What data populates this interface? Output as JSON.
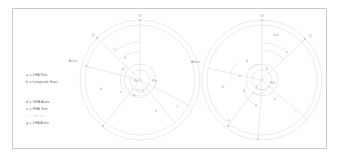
{
  "figure": {
    "background": "#ffffff",
    "frame_color": "#c9c9c9",
    "line_color": "#cfcfcf",
    "text_color": "#9a9a9a",
    "faint_color": "#e6e6e6"
  },
  "legend": {
    "group_one": [
      {
        "key": "a",
        "text": "a = LHA Star"
      },
      {
        "key": "b",
        "text": "b = Longitude East"
      }
    ],
    "group_two": [
      {
        "key": "d",
        "text": "d = GHA Aries"
      },
      {
        "key": "e",
        "text": "e = SHA Star"
      },
      {
        "key": "f",
        "text": "f = LHA Sun",
        "faint": "true"
      },
      {
        "key": "g",
        "text": "g = LHA Aries"
      }
    ]
  },
  "diagrams": [
    {
      "name": "left-diagram",
      "labels": {
        "greenwich": "G",
        "observer": "Q",
        "aries": "Aries",
        "pole": "Pn",
        "center": "Pn"
      },
      "arc_labels": [
        "a",
        "b",
        "c",
        "d",
        "e",
        "f",
        "g"
      ]
    },
    {
      "name": "right-diagram",
      "labels": {
        "greenwich": "G",
        "observer": "Q",
        "aries": "Aries",
        "pole": "Pn",
        "difference": "b-a"
      },
      "arc_labels": [
        "a",
        "b",
        "c",
        "d",
        "e",
        "f",
        "g"
      ]
    }
  ]
}
